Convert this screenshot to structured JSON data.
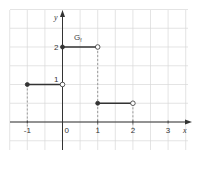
{
  "chart_data": {
    "type": "line",
    "title": "",
    "xlabel": "x",
    "ylabel": "y",
    "graph_label": "G",
    "graph_label_sub": "f",
    "xlim": [
      -1.5,
      3.5
    ],
    "ylim": [
      -0.5,
      3.0
    ],
    "grid": true,
    "grid_step": 0.5,
    "x_ticks": [
      "-1",
      "0",
      "1",
      "2",
      "3"
    ],
    "y_ticks": [
      "1",
      "2"
    ],
    "series": [
      {
        "name": "segment-1",
        "x": [
          -1,
          0
        ],
        "y": [
          1,
          1
        ],
        "start": "closed",
        "end": "open"
      },
      {
        "name": "segment-2",
        "x": [
          0,
          1
        ],
        "y": [
          2,
          2
        ],
        "start": "closed",
        "end": "open"
      },
      {
        "name": "segment-3",
        "x": [
          1,
          2
        ],
        "y": [
          0.5,
          0.5
        ],
        "start": "closed",
        "end": "open"
      }
    ],
    "dashed_guides": [
      {
        "x": -1,
        "y_from": 1
      },
      {
        "x": 1,
        "y_from": 2
      },
      {
        "x": 2,
        "y_from": 0.5
      }
    ]
  },
  "colors": {
    "grid": "#d8d8d8",
    "axis": "#333333",
    "line": "#333333",
    "guide": "#888888"
  }
}
